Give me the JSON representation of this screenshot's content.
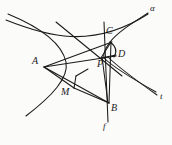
{
  "figure": {
    "kind": "geometry-diagram",
    "background_color": "#fbfbfa",
    "stroke_color": "#1a1a1a",
    "labels": [
      {
        "name": "label-alpha",
        "text": "α",
        "x": 152,
        "y": 8,
        "role": "curve-name",
        "size": "cv"
      },
      {
        "name": "label-C",
        "text": "C",
        "x": 106,
        "y": 30,
        "role": "point",
        "size": "pt"
      },
      {
        "name": "label-D",
        "text": "D",
        "x": 119,
        "y": 53,
        "role": "point",
        "size": "pt"
      },
      {
        "name": "label-A",
        "text": "A",
        "x": 33,
        "y": 61,
        "role": "point",
        "size": "pt"
      },
      {
        "name": "label-P",
        "text": "P",
        "x": 98,
        "y": 63,
        "role": "point",
        "size": "pt"
      },
      {
        "name": "label-M",
        "text": "M",
        "x": 62,
        "y": 92,
        "role": "point",
        "size": "pt"
      },
      {
        "name": "label-B",
        "text": "B",
        "x": 110,
        "y": 109,
        "role": "point",
        "size": "pt"
      },
      {
        "name": "label-t",
        "text": "t",
        "x": 160,
        "y": 97,
        "role": "line-name",
        "size": "cv"
      },
      {
        "name": "label-f",
        "text": "f",
        "x": 103,
        "y": 127,
        "role": "line-name",
        "size": "cv"
      }
    ],
    "points": {
      "A": {
        "x": 44,
        "y": 67
      },
      "P": {
        "x": 103,
        "y": 57
      },
      "B": {
        "x": 108,
        "y": 104
      },
      "C": {
        "x": 111,
        "y": 41
      },
      "D": {
        "x": 115,
        "y": 57
      },
      "M": {
        "x": 74,
        "y": 87
      }
    },
    "curves": [
      {
        "name": "hyperbola-branch-alpha",
        "type": "conic-branch",
        "label": "α"
      },
      {
        "name": "asymptote-upper-left",
        "type": "asymptote"
      },
      {
        "name": "asymptote-lower-right",
        "type": "asymptote"
      },
      {
        "name": "line-f-vertical",
        "type": "line",
        "label": "f"
      },
      {
        "name": "tangent-line-t",
        "type": "line",
        "label": "t"
      },
      {
        "name": "arc-C-D",
        "type": "arc"
      },
      {
        "name": "segment-A-P",
        "type": "segment"
      },
      {
        "name": "segment-A-M",
        "type": "segment"
      },
      {
        "name": "segment-A-C",
        "type": "segment"
      },
      {
        "name": "segment-A-B",
        "type": "segment"
      },
      {
        "name": "segment-M-B",
        "type": "segment"
      },
      {
        "name": "segment-P-B",
        "type": "segment"
      },
      {
        "name": "segment-P-C",
        "type": "segment"
      },
      {
        "name": "segment-C-B",
        "type": "segment"
      },
      {
        "name": "segment-P-D",
        "type": "segment"
      }
    ]
  }
}
